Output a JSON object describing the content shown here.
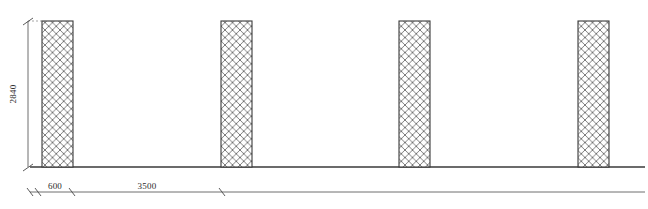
{
  "drawing": {
    "title": "Structural Column Elevation",
    "background_color": "#ffffff",
    "line_color": "#3a3a3a",
    "hatch_color": "#6e6e6e",
    "dimension_color": "#4a4a4a",
    "text_color": "#2b2b2b",
    "canvas": {
      "width": 648,
      "height": 209
    }
  },
  "vertical_dimension": {
    "label": "2840",
    "name": "column-height",
    "line_x": 28,
    "y_top": 21,
    "y_bottom": 167,
    "text_x": 16,
    "text_y": 94
  },
  "horizontal_dimensions": [
    {
      "label": "600",
      "name": "column-width-dimension",
      "x_start": 38,
      "x_end": 72,
      "y": 192,
      "text_x": 55,
      "text_y": 188
    },
    {
      "label": "3500",
      "name": "column-spacing-dimension",
      "x_start": 72,
      "x_end": 222,
      "y": 192,
      "text_x": 147,
      "text_y": 188
    }
  ],
  "dimension_line": {
    "name": "baseline-dimension-line",
    "x_start": 30,
    "x_end": 645,
    "y": 192
  },
  "ground_line": {
    "name": "ground-line",
    "x_start": 30,
    "x_end": 645,
    "y": 167
  },
  "columns": [
    {
      "name": "column-1",
      "x": 42,
      "y": 21,
      "width": 31,
      "height": 146
    },
    {
      "name": "column-2",
      "x": 221,
      "y": 21,
      "width": 31,
      "height": 146
    },
    {
      "name": "column-3",
      "x": 399,
      "y": 21,
      "width": 31,
      "height": 146
    },
    {
      "name": "column-4",
      "x": 578,
      "y": 21,
      "width": 31,
      "height": 146
    }
  ],
  "hatch": {
    "pattern_name": "diagonal-cross-hatch",
    "spacing_px": 7.5,
    "stroke_width": 0.9
  }
}
